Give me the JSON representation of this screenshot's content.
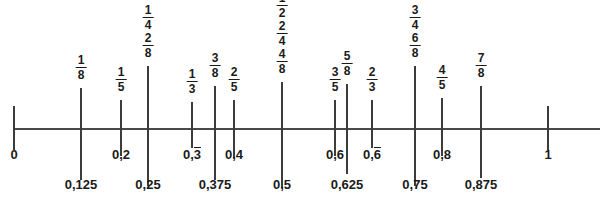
{
  "diagram": {
    "type": "number-line",
    "axis": {
      "start_value": 0,
      "end_value": 1,
      "start_px": 14,
      "end_px": 548,
      "line_left_px": 14,
      "line_right_px": 600,
      "line_y_px": 128,
      "color": "#4a4a4a",
      "text_color": "#1a1a1a"
    },
    "endpoints": [
      {
        "name": "zero",
        "label": "0",
        "value": 0,
        "x": 14
      },
      {
        "name": "one",
        "label": "1",
        "value": 1,
        "x": 548
      }
    ],
    "ticks": [
      {
        "id": "t-0",
        "value": 0,
        "x": 14,
        "up": 22,
        "down": 22,
        "fractions": [],
        "decimal": null,
        "decimal_overline": false,
        "decimal_row": 0
      },
      {
        "id": "t-1_8",
        "value": 0.125,
        "x": 81,
        "up": 40,
        "down": 52,
        "fractions": [
          "1/8"
        ],
        "decimal": "0,125",
        "decimal_overline": false,
        "decimal_row": 1
      },
      {
        "id": "t-1_5",
        "value": 0.2,
        "x": 121,
        "up": 28,
        "down": 28,
        "fractions": [
          "1/5"
        ],
        "decimal": "0,2",
        "decimal_overline": false,
        "decimal_row": 0
      },
      {
        "id": "t-1_4",
        "value": 0.25,
        "x": 148,
        "up": 62,
        "down": 58,
        "fractions": [
          "1/4",
          "2/8"
        ],
        "decimal": "0,25",
        "decimal_overline": false,
        "decimal_row": 1
      },
      {
        "id": "t-1_3",
        "value": 0.333,
        "x": 192,
        "up": 26,
        "down": 20,
        "fractions": [
          "1/3"
        ],
        "decimal": "0,3",
        "decimal_overline": true,
        "decimal_row": 0
      },
      {
        "id": "t-3_8",
        "value": 0.375,
        "x": 215,
        "up": 42,
        "down": 52,
        "fractions": [
          "3/8"
        ],
        "decimal": "0,375",
        "decimal_overline": false,
        "decimal_row": 1
      },
      {
        "id": "t-2_5",
        "value": 0.4,
        "x": 234,
        "up": 28,
        "down": 30,
        "fractions": [
          "2/5"
        ],
        "decimal": "0,4",
        "decimal_overline": false,
        "decimal_row": 0
      },
      {
        "id": "t-1_2",
        "value": 0.5,
        "x": 282,
        "up": 46,
        "down": 60,
        "fractions": [
          "1/2",
          "2/4",
          "4/8"
        ],
        "decimal": "0,5",
        "decimal_overline": false,
        "decimal_row": 1
      },
      {
        "id": "t-3_5",
        "value": 0.6,
        "x": 335,
        "up": 28,
        "down": 28,
        "fractions": [
          "3/5"
        ],
        "decimal": "0,6",
        "decimal_overline": false,
        "decimal_row": 0
      },
      {
        "id": "t-5_8",
        "value": 0.625,
        "x": 347,
        "up": 44,
        "down": 46,
        "fractions": [
          "5/8"
        ],
        "decimal": "0,625",
        "decimal_overline": false,
        "decimal_row": 1
      },
      {
        "id": "t-2_3",
        "value": 0.666,
        "x": 372,
        "up": 28,
        "down": 20,
        "fractions": [
          "2/3"
        ],
        "decimal": "0,6",
        "decimal_overline": true,
        "decimal_row": 0
      },
      {
        "id": "t-3_4",
        "value": 0.75,
        "x": 415,
        "up": 62,
        "down": 58,
        "fractions": [
          "3/4",
          "6/8"
        ],
        "decimal": "0,75",
        "decimal_overline": false,
        "decimal_row": 1
      },
      {
        "id": "t-4_5",
        "value": 0.8,
        "x": 442,
        "up": 30,
        "down": 28,
        "fractions": [
          "4/5"
        ],
        "decimal": "0,8",
        "decimal_overline": false,
        "decimal_row": 0
      },
      {
        "id": "t-7_8",
        "value": 0.875,
        "x": 481,
        "up": 42,
        "down": 50,
        "fractions": [
          "7/8"
        ],
        "decimal": "0,875",
        "decimal_overline": false,
        "decimal_row": 1
      },
      {
        "id": "t-1",
        "value": 1,
        "x": 548,
        "up": 22,
        "down": 22,
        "fractions": [],
        "decimal": null,
        "decimal_overline": false,
        "decimal_row": 0
      }
    ],
    "decimal_rows_y": [
      148,
      178
    ],
    "fraction_stack": {
      "row_height": 28,
      "bottom_gap": 6
    }
  }
}
